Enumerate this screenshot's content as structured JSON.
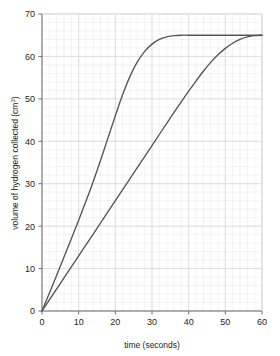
{
  "chart_data": {
    "type": "line",
    "title": "",
    "xlabel": "time (seconds)",
    "ylabel": "volume of hydrogen collected (cm3)",
    "ylabel_base": "volume of hydrogen collected (cm",
    "ylabel_sup": "3",
    "ylabel_tail": ")",
    "xlim": [
      0,
      60
    ],
    "ylim": [
      0,
      70
    ],
    "xticks": [
      0,
      10,
      20,
      30,
      40,
      50,
      60
    ],
    "yticks": [
      0,
      10,
      20,
      30,
      40,
      50,
      60,
      70
    ],
    "xtick_labels": [
      "0",
      "10",
      "20",
      "30",
      "40",
      "50",
      "60"
    ],
    "ytick_labels": [
      "0",
      "10",
      "20",
      "30",
      "40",
      "50",
      "60",
      "70"
    ],
    "grid": true,
    "minor_grid": true,
    "minor_grid_step_x": 2,
    "minor_grid_step_y": 2,
    "legend": "none",
    "plateau_value": 65,
    "line_color": "#565557",
    "grid_major_color": "#dedbe0",
    "grid_minor_color": "#efedf1",
    "axis_color": "#6f6d70",
    "background": "#ffffff",
    "series": [
      {
        "name": "fast reaction",
        "x": [
          0,
          2,
          4,
          6,
          8,
          10,
          12,
          14,
          16,
          18,
          20,
          22,
          24,
          26,
          28,
          30,
          32,
          34,
          36,
          38,
          40,
          45,
          50,
          55,
          60
        ],
        "y": [
          0,
          4.2,
          8.4,
          12.7,
          17.0,
          21.4,
          25.9,
          30.6,
          35.6,
          40.8,
          46.0,
          51.0,
          55.3,
          58.7,
          61.2,
          62.9,
          64.0,
          64.6,
          64.9,
          65.0,
          65.0,
          65.0,
          65.0,
          65.0,
          65.0
        ]
      },
      {
        "name": "slow reaction",
        "x": [
          0,
          2,
          4,
          6,
          8,
          10,
          12,
          14,
          16,
          18,
          20,
          22,
          24,
          26,
          28,
          30,
          32,
          34,
          36,
          38,
          40,
          42,
          44,
          46,
          48,
          50,
          52,
          54,
          56,
          58,
          60
        ],
        "y": [
          0,
          2.6,
          5.2,
          7.8,
          10.4,
          13.0,
          15.6,
          18.2,
          20.8,
          23.4,
          26.0,
          28.6,
          31.2,
          33.8,
          36.4,
          39.0,
          41.6,
          44.2,
          46.8,
          49.3,
          51.8,
          54.2,
          56.5,
          58.6,
          60.4,
          61.9,
          63.1,
          64.0,
          64.6,
          64.9,
          65.0
        ]
      }
    ]
  }
}
